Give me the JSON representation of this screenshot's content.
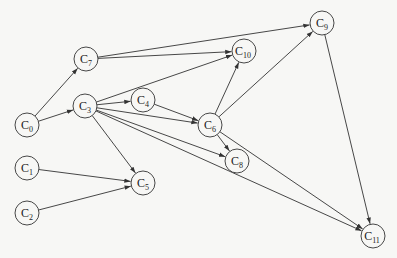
{
  "diagram": {
    "type": "directed-graph",
    "nodes": [
      {
        "id": "C0",
        "label": "C",
        "sub": "0",
        "x": 27,
        "y": 125
      },
      {
        "id": "C1",
        "label": "C",
        "sub": "1",
        "x": 27,
        "y": 168
      },
      {
        "id": "C2",
        "label": "C",
        "sub": "2",
        "x": 27,
        "y": 213
      },
      {
        "id": "C3",
        "label": "C",
        "sub": "3",
        "x": 85,
        "y": 106
      },
      {
        "id": "C4",
        "label": "C",
        "sub": "4",
        "x": 143,
        "y": 100
      },
      {
        "id": "C5",
        "label": "C",
        "sub": "5",
        "x": 143,
        "y": 183
      },
      {
        "id": "C6",
        "label": "C",
        "sub": "6",
        "x": 210,
        "y": 125
      },
      {
        "id": "C7",
        "label": "C",
        "sub": "7",
        "x": 86,
        "y": 59
      },
      {
        "id": "C8",
        "label": "C",
        "sub": "8",
        "x": 237,
        "y": 161
      },
      {
        "id": "C9",
        "label": "C",
        "sub": "9",
        "x": 322,
        "y": 23
      },
      {
        "id": "C10",
        "label": "C",
        "sub": "10",
        "x": 244,
        "y": 51
      },
      {
        "id": "C11",
        "label": "C",
        "sub": "11",
        "x": 373,
        "y": 236
      }
    ],
    "edges": [
      [
        "C0",
        "C7"
      ],
      [
        "C0",
        "C3"
      ],
      [
        "C7",
        "C9"
      ],
      [
        "C7",
        "C10"
      ],
      [
        "C3",
        "C10"
      ],
      [
        "C3",
        "C4"
      ],
      [
        "C3",
        "C6"
      ],
      [
        "C3",
        "C8"
      ],
      [
        "C3",
        "C5"
      ],
      [
        "C3",
        "C11"
      ],
      [
        "C4",
        "C6"
      ],
      [
        "C6",
        "C10"
      ],
      [
        "C6",
        "C9"
      ],
      [
        "C6",
        "C8"
      ],
      [
        "C6",
        "C11"
      ],
      [
        "C9",
        "C11"
      ],
      [
        "C1",
        "C5"
      ],
      [
        "C2",
        "C5"
      ]
    ],
    "colors": {
      "stroke": "#333333",
      "background": "#f7f7f5",
      "node_fill": "#f7f7f5"
    },
    "node_radius": 12
  }
}
